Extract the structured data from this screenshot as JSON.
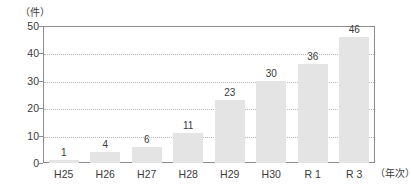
{
  "chart_data": {
    "type": "bar",
    "title": "",
    "subtitle": "",
    "categories": [
      "H25",
      "H26",
      "H27",
      "H28",
      "H29",
      "H30",
      "R 1",
      "R 3"
    ],
    "values": [
      1,
      4,
      6,
      11,
      23,
      30,
      36,
      46
    ],
    "data_labels": [
      "1",
      "4",
      "6",
      "11",
      "23",
      "30",
      "36",
      "46"
    ],
    "xlabel": "（年次）",
    "ylabel": "（件）",
    "ylim": [
      0,
      50
    ],
    "yticks": [
      0,
      10,
      20,
      30,
      40,
      50
    ],
    "ytick_labels": [
      "0",
      "10",
      "20",
      "30",
      "40",
      "50"
    ],
    "gridlines": [
      10,
      20,
      30,
      40
    ],
    "grid": true,
    "grid_style": "dotted-horizontal",
    "legend": false,
    "legend_position": "none",
    "bar_color": "#e4e4e4",
    "axis_color": "#8d8d8d",
    "grid_color": "#b9b9b9",
    "text_color": "#3a3a3a",
    "background": "#ffffff"
  }
}
